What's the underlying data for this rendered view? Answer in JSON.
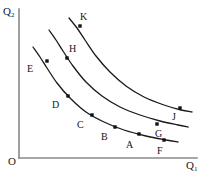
{
  "figure": {
    "origin_label": "O",
    "axes": {
      "y_label_base": "Q",
      "y_label_sub": "2",
      "x_label_base": "Q",
      "x_label_sub": "1"
    },
    "colors": {
      "axis": "#8a8a8a",
      "curve": "#1a1a1a",
      "point": "#111111",
      "text": "#141414",
      "background": "#ffffff"
    }
  },
  "chart_data": {
    "type": "line",
    "xlabel": "Q1",
    "ylabel": "Q2",
    "grid": false,
    "legend": "none",
    "axis_style": "two-axis-origin-O",
    "xlim": [
      0,
      207
    ],
    "ylim": [
      0,
      179
    ],
    "note": "Three convex-to-origin indifference curves; higher curves denote greater utility. Coordinates are in screenshot pixel space (y increases downward).",
    "series": [
      {
        "name": "curve-1-lowest",
        "path_points": [
          [
            33,
            47
          ],
          [
            40,
            57
          ],
          [
            47,
            68
          ],
          [
            57,
            83
          ],
          [
            70,
            98
          ],
          [
            86,
            112
          ],
          [
            104,
            122
          ],
          [
            124,
            130
          ],
          [
            146,
            136
          ],
          [
            166,
            140
          ],
          [
            178,
            142
          ]
        ],
        "labeled_points": [
          {
            "id": "E",
            "label": "E",
            "x": 47,
            "y": 61,
            "label_x": 27,
            "label_y": 64
          },
          {
            "id": "D",
            "label": "D",
            "x": 68,
            "y": 96,
            "label_x": 52,
            "label_y": 100
          },
          {
            "id": "C",
            "label": "C",
            "x": 92,
            "y": 115,
            "label_x": 77,
            "label_y": 120
          },
          {
            "id": "B",
            "label": "B",
            "x": 115,
            "y": 127,
            "label_x": 101,
            "label_y": 132
          },
          {
            "id": "A",
            "label": "A",
            "x": 139,
            "y": 134,
            "label_x": 126,
            "label_y": 140
          },
          {
            "id": "F",
            "label": "F",
            "x": 164,
            "y": 140,
            "label_x": 157,
            "label_y": 146
          }
        ]
      },
      {
        "name": "curve-2-middle",
        "path_points": [
          [
            49,
            30
          ],
          [
            56,
            40
          ],
          [
            63,
            51
          ],
          [
            73,
            66
          ],
          [
            86,
            82
          ],
          [
            102,
            96
          ],
          [
            120,
            107
          ],
          [
            140,
            115
          ],
          [
            160,
            121
          ],
          [
            178,
            125
          ],
          [
            188,
            127
          ]
        ],
        "labeled_points": [
          {
            "id": "H",
            "label": "H",
            "x": 67,
            "y": 58,
            "label_x": 69,
            "label_y": 44
          },
          {
            "id": "G",
            "label": "G",
            "x": 157,
            "y": 124,
            "label_x": 155,
            "label_y": 129
          }
        ]
      },
      {
        "name": "curve-3-top",
        "path_points": [
          [
            69,
            18
          ],
          [
            77,
            28
          ],
          [
            85,
            40
          ],
          [
            96,
            56
          ],
          [
            110,
            72
          ],
          [
            126,
            86
          ],
          [
            144,
            97
          ],
          [
            164,
            105
          ],
          [
            181,
            110
          ],
          [
            192,
            112
          ]
        ],
        "labeled_points": [
          {
            "id": "K",
            "label": "K",
            "x": 80,
            "y": 26,
            "label_x": 80,
            "label_y": 12
          },
          {
            "id": "J",
            "label": "J",
            "x": 180,
            "y": 108,
            "label_x": 172,
            "label_y": 112
          }
        ]
      }
    ],
    "axis_lines": {
      "y_axis": {
        "x": 19,
        "y_top": 9,
        "y_bottom": 158
      },
      "x_axis": {
        "y": 158,
        "x_left": 19,
        "x_right": 197
      }
    }
  }
}
